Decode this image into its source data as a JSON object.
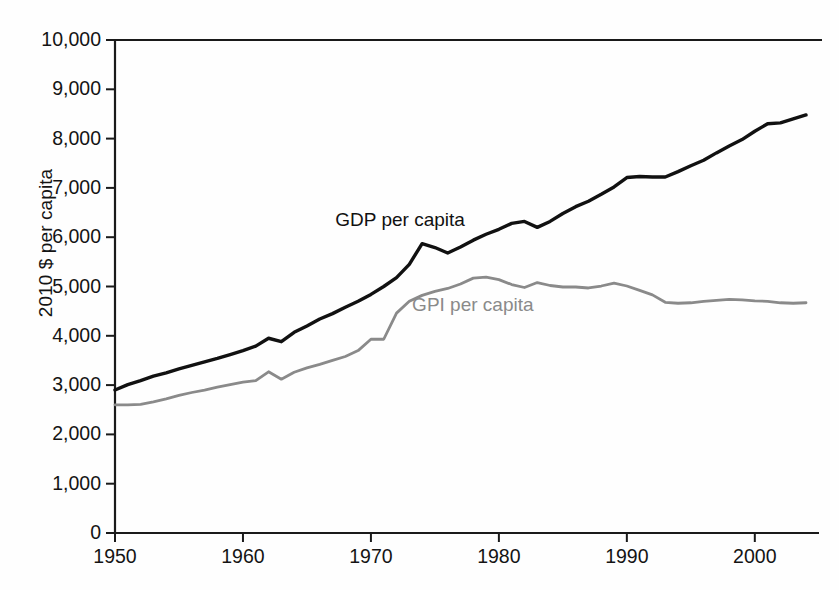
{
  "figure": {
    "background_color": "#fefefe",
    "axis_color": "#1a1a1a"
  },
  "axes": {
    "ylabel": "2010 $ per capita",
    "yticks": [
      "0",
      "1,000",
      "2,000",
      "3,000",
      "4,000",
      "5,000",
      "6,000",
      "7,000",
      "8,000",
      "9,000",
      "10,000"
    ],
    "xticks": [
      "1950",
      "1960",
      "1970",
      "1980",
      "1990",
      "2000"
    ]
  },
  "series_labels": {
    "gdp": "GDP per capita",
    "gpi": "GPI per capita"
  },
  "chart_data": {
    "type": "line",
    "title": "",
    "xlabel": "",
    "ylabel": "2010 $ per capita",
    "xlim": [
      1950,
      2004
    ],
    "ylim": [
      0,
      10000
    ],
    "grid": false,
    "legend": "inline-annotations",
    "xtick_values": [
      1950,
      1960,
      1970,
      1980,
      1990,
      2000
    ],
    "ytick_values": [
      0,
      1000,
      2000,
      3000,
      4000,
      5000,
      6000,
      7000,
      8000,
      9000,
      10000
    ],
    "x": [
      1950,
      1951,
      1952,
      1953,
      1954,
      1955,
      1956,
      1957,
      1958,
      1959,
      1960,
      1961,
      1962,
      1963,
      1964,
      1965,
      1966,
      1967,
      1968,
      1969,
      1970,
      1971,
      1972,
      1973,
      1974,
      1975,
      1976,
      1977,
      1978,
      1979,
      1980,
      1981,
      1982,
      1983,
      1984,
      1985,
      1986,
      1987,
      1988,
      1989,
      1990,
      1991,
      1992,
      1993,
      1994,
      1995,
      1996,
      1997,
      1998,
      1999,
      2000,
      2001,
      2002,
      2003,
      2004
    ],
    "series": [
      {
        "name": "GDP per capita",
        "color": "#111111",
        "values": [
          2900,
          3010,
          3090,
          3180,
          3250,
          3330,
          3400,
          3470,
          3540,
          3620,
          3700,
          3790,
          3950,
          3880,
          4070,
          4200,
          4340,
          4450,
          4580,
          4700,
          4840,
          5000,
          5180,
          5450,
          5870,
          5790,
          5680,
          5800,
          5940,
          6060,
          6160,
          6280,
          6320,
          6200,
          6320,
          6480,
          6620,
          6730,
          6870,
          7020,
          7210,
          7230,
          7220,
          7220,
          7330,
          7450,
          7560,
          7710,
          7850,
          7980,
          8150,
          8300,
          8320,
          8400,
          8480
        ]
      },
      {
        "name": "GPI per capita",
        "color": "#8a8a8a",
        "values": [
          2600,
          2600,
          2610,
          2660,
          2720,
          2790,
          2850,
          2900,
          2960,
          3010,
          3060,
          3090,
          3270,
          3120,
          3260,
          3350,
          3420,
          3500,
          3580,
          3700,
          3930,
          3930,
          4460,
          4700,
          4820,
          4900,
          4960,
          5050,
          5170,
          5190,
          5140,
          5040,
          4980,
          5080,
          5020,
          4990,
          4990,
          4970,
          5010,
          5070,
          5010,
          4920,
          4830,
          4680,
          4660,
          4670,
          4700,
          4720,
          4740,
          4730,
          4710,
          4700,
          4670,
          4660,
          4670
        ]
      }
    ],
    "annotations": [
      {
        "text": "GDP per capita",
        "x": 1968,
        "y": 6350,
        "color": "#111111"
      },
      {
        "text": "GPI per capita",
        "x": 1974,
        "y": 4630,
        "color": "#8a8a8a"
      }
    ]
  }
}
